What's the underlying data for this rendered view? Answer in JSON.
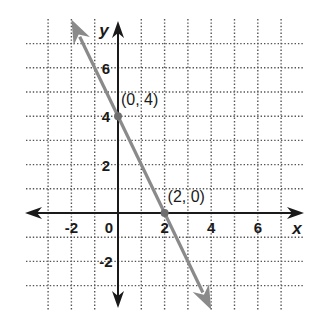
{
  "chart_data": {
    "type": "line",
    "title": "",
    "xlabel": "x",
    "ylabel": "y",
    "xlim": [
      -3.9,
      8.0
    ],
    "ylim": [
      -4.1,
      8.0
    ],
    "grid": true,
    "grid_style": "dotted",
    "x_ticks": [
      -2,
      0,
      2,
      4,
      6
    ],
    "x_tick_labels": [
      "-2",
      "0",
      "2",
      "4",
      "6"
    ],
    "y_ticks": [
      -2,
      2,
      4,
      6
    ],
    "y_tick_labels": [
      "-2",
      "2",
      "4",
      "6"
    ],
    "series": [
      {
        "name": "y = -2x + 4",
        "color": "#8a8a8a",
        "arrows_both_ends": true,
        "x": [
          -2,
          0,
          2,
          4
        ],
        "y": [
          8,
          4,
          0,
          -4
        ]
      }
    ],
    "points": [
      {
        "x": 0,
        "y": 4,
        "label": "(0, 4)"
      },
      {
        "x": 2,
        "y": 0,
        "label": "(2, 0)"
      }
    ]
  },
  "colors": {
    "axis": "#1a1a1a",
    "grid": "#555555",
    "line": "#8a8a8a",
    "background": "#ffffff"
  }
}
